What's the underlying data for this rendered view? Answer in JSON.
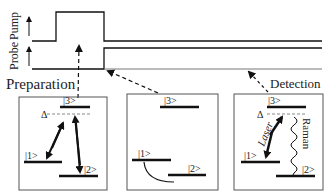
{
  "timing": {
    "pump_label": "Pump",
    "probe_label": "Probe"
  },
  "stages": {
    "preparation": "Preparation",
    "detection": "Detection"
  },
  "panels": {
    "preparation": {
      "level3": "|3>",
      "level1": "|1>",
      "level2": "|2>",
      "detuning": "Δ"
    },
    "evolution": {
      "level3": "|3>",
      "level1": "|1>",
      "level2": "|2>"
    },
    "detection": {
      "level3": "|3>",
      "level1": "|1>",
      "level2": "|2>",
      "detuning": "Δ",
      "laser": "Laser",
      "raman": "Raman"
    }
  },
  "colors": {
    "line": "#1a1a1a",
    "box": "#555555",
    "dashed": "#888888"
  }
}
